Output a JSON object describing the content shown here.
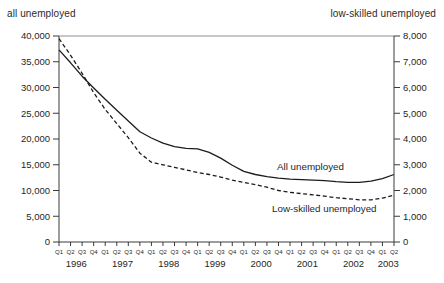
{
  "chart_data": {
    "type": "line",
    "grid": "off",
    "legend": "inline-labels",
    "left_axis": {
      "title": "all unemployed",
      "min": 0,
      "max": 40000,
      "tick_step": 5000,
      "tick_labels": [
        "0",
        "5,000",
        "10,000",
        "15,000",
        "20,000",
        "25,000",
        "30,000",
        "35,000",
        "40,000"
      ]
    },
    "right_axis": {
      "title": "low-skilled unemployed",
      "min": 0,
      "max": 8000,
      "tick_step": 1000,
      "tick_labels": [
        "0",
        "1,000",
        "2,000",
        "3,000",
        "4,000",
        "5,000",
        "6,000",
        "7,000",
        "8,000"
      ]
    },
    "quarter_labels": [
      "Q1",
      "Q2",
      "Q3",
      "Q4",
      "Q1",
      "Q2",
      "Q3",
      "Q4",
      "Q1",
      "Q2",
      "Q3",
      "Q4",
      "Q1",
      "Q2",
      "Q3",
      "Q4",
      "Q1",
      "Q2",
      "Q3",
      "Q4",
      "Q1",
      "Q2",
      "Q3",
      "Q4",
      "Q1",
      "Q2",
      "Q3",
      "Q4",
      "Q1",
      "Q2"
    ],
    "year_groups": [
      {
        "label": "1996",
        "quarters": 4
      },
      {
        "label": "1997",
        "quarters": 4
      },
      {
        "label": "1998",
        "quarters": 4
      },
      {
        "label": "1999",
        "quarters": 4
      },
      {
        "label": "2000",
        "quarters": 4
      },
      {
        "label": "2001",
        "quarters": 4
      },
      {
        "label": "2002",
        "quarters": 4
      },
      {
        "label": "2003",
        "quarters": 2
      }
    ],
    "series": [
      {
        "name": "All unemployed",
        "axis": "left",
        "line_style": "solid",
        "color": "#1c1c1c",
        "values": [
          37300,
          34800,
          32200,
          29900,
          27700,
          25600,
          23500,
          21400,
          20200,
          19200,
          18500,
          18200,
          18100,
          17400,
          16300,
          14900,
          13700,
          13100,
          12700,
          12400,
          12200,
          12100,
          12000,
          11900,
          11700,
          11600,
          11600,
          11800,
          12300,
          13100
        ]
      },
      {
        "name": "Low-skilled unemployed",
        "axis": "right",
        "line_style": "dashed",
        "color": "#1c1c1c",
        "values": [
          7900,
          7250,
          6550,
          5800,
          5150,
          4600,
          4050,
          3450,
          3100,
          3000,
          2900,
          2800,
          2700,
          2620,
          2520,
          2400,
          2320,
          2230,
          2130,
          2000,
          1930,
          1880,
          1830,
          1780,
          1720,
          1680,
          1640,
          1640,
          1700,
          1820
        ]
      }
    ],
    "annotations": [
      {
        "text": "All unemployed"
      },
      {
        "text": "Low-skilled unemployed"
      }
    ]
  }
}
